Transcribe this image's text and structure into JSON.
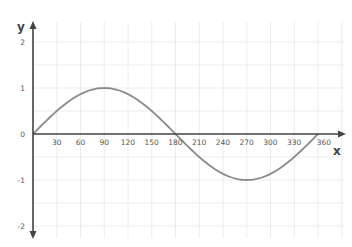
{
  "chart_data": {
    "type": "line",
    "title": "",
    "xlabel": "x",
    "ylabel": "y",
    "xlim": [
      0,
      360
    ],
    "ylim": [
      -2,
      2
    ],
    "grid": true,
    "legend": "none",
    "x_ticks": [
      30,
      60,
      90,
      120,
      150,
      180,
      210,
      240,
      270,
      300,
      330,
      360
    ],
    "x_tick_labels": [
      "30",
      "60",
      "90",
      "120",
      "150",
      "180",
      "210",
      "240",
      "270",
      "300",
      "330",
      "360"
    ],
    "y_ticks": [
      2,
      1,
      0,
      -1,
      -2
    ],
    "y_tick_labels": [
      "2",
      "1",
      "0",
      "-1",
      "-2"
    ],
    "series": [
      {
        "name": "y = sin(x)",
        "color": "#8a8a8a",
        "function": "sin",
        "x": [
          0,
          30,
          60,
          90,
          120,
          150,
          180,
          210,
          240,
          270,
          300,
          330,
          360
        ],
        "y": [
          0,
          0.5,
          0.866,
          1,
          0.866,
          0.5,
          0,
          -0.5,
          -0.866,
          -1,
          -0.866,
          -0.5,
          0
        ]
      }
    ]
  }
}
